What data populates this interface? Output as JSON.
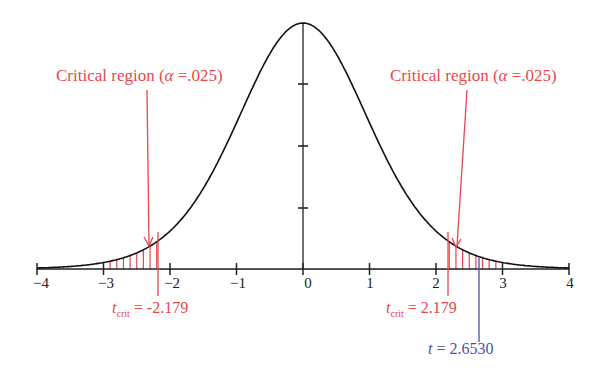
{
  "chart_data": {
    "type": "line",
    "title": "",
    "xlabel": "",
    "ylabel": "",
    "xlim": [
      -4,
      4
    ],
    "x_ticks": [
      "−4",
      "−3",
      "−2",
      "−1",
      "0",
      "1",
      "2",
      "3",
      "4"
    ],
    "y_axis_ticks_count": 3,
    "grid": false,
    "legend": null,
    "series": [
      {
        "name": "t density",
        "color": "#111111",
        "df": 12,
        "peak_x": 0
      }
    ],
    "shaded_regions": [
      {
        "name": "left critical region",
        "from": -4,
        "to": -2.179,
        "color": "#e8474c"
      },
      {
        "name": "right critical region",
        "from": 2.179,
        "to": 4,
        "color": "#e8474c"
      }
    ],
    "annotations": {
      "left_region": {
        "text_prefix": "Critical region (",
        "alpha_symbol": "α",
        "text_suffix": " =.025)"
      },
      "right_region": {
        "text_prefix": "Critical region (",
        "alpha_symbol": "α",
        "text_suffix": " =.025)"
      },
      "left_crit": {
        "t": "t",
        "sub": "crit",
        "value_text": " = -2.179",
        "x": -2.179
      },
      "right_crit": {
        "t": "t",
        "sub": "crit",
        "value_text": " = 2.179",
        "x": 2.179
      },
      "observed": {
        "t": "t",
        "value_text": " = 2.6530",
        "x": 2.653,
        "color": "#4a4fb0"
      }
    }
  }
}
